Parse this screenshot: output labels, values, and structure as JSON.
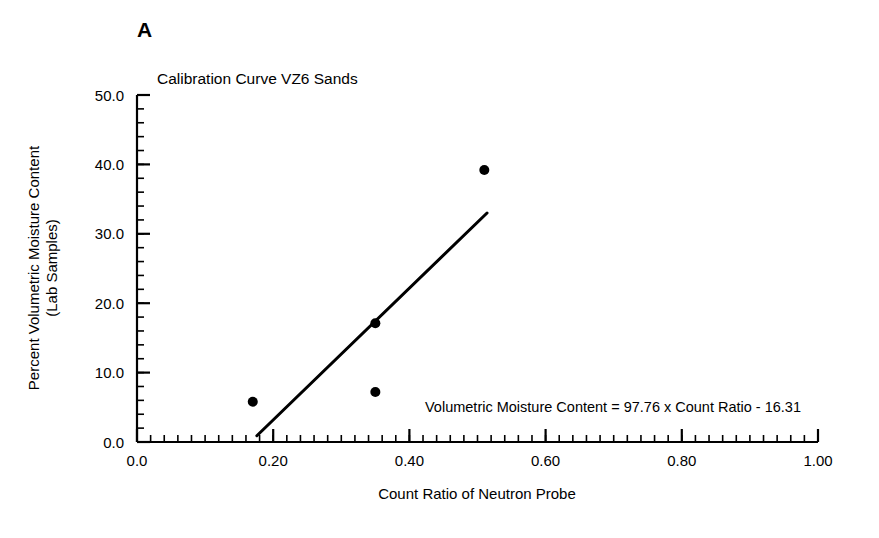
{
  "panel": {
    "label": "A"
  },
  "chart_data": {
    "type": "scatter",
    "title": "Calibration Curve VZ6 Sands",
    "xlabel": "Count Ratio of Neutron Probe",
    "ylabel_line1": "Percent Volumetric Moisture Content",
    "ylabel_line2": "(Lab Samples)",
    "xlim": [
      0.0,
      1.0
    ],
    "ylim": [
      0.0,
      50.0
    ],
    "x_major_step": 0.2,
    "x_minor_step": 0.02,
    "y_major_step": 10.0,
    "y_minor_step": 2.0,
    "grid": false,
    "legend": "none",
    "xticks": [
      "0.0",
      "0.20",
      "0.40",
      "0.60",
      "0.80",
      "1.00"
    ],
    "xtick_values": [
      0.0,
      0.2,
      0.4,
      0.6,
      0.8,
      1.0
    ],
    "yticks": [
      "0.0",
      "10.0",
      "20.0",
      "30.0",
      "40.0",
      "50.0"
    ],
    "ytick_values": [
      0.0,
      10.0,
      20.0,
      30.0,
      40.0,
      50.0
    ],
    "points": [
      {
        "x": 0.17,
        "y": 5.8
      },
      {
        "x": 0.35,
        "y": 7.2
      },
      {
        "x": 0.35,
        "y": 17.1
      },
      {
        "x": 0.51,
        "y": 39.2
      }
    ],
    "marker": "filled-circle",
    "marker_color": "#000000",
    "marker_size": 5,
    "series": [
      {
        "name": "Lab Samples",
        "x": [
          0.17,
          0.35,
          0.35,
          0.51
        ],
        "values": [
          5.8,
          7.2,
          17.1,
          39.2
        ]
      }
    ],
    "fit_line": {
      "type": "linear",
      "slope": 97.76,
      "intercept": -16.31,
      "x_start": 0.176,
      "x_end": 0.514,
      "y_start": 0.9,
      "y_end": 33.0,
      "color": "#000000",
      "width": 3
    },
    "annotations": [
      {
        "name": "regression-equation",
        "text": "Volumetric Moisture Content = 97.76 x Count Ratio - 16.31",
        "x": 0.425,
        "y": 4.3
      }
    ],
    "axis_color": "#000000"
  }
}
